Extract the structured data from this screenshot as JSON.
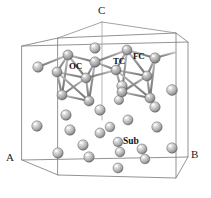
{
  "figure": {
    "kind": "crystal-unit-cell-diagram",
    "background": "#ffffff",
    "edge_color": "#6f6f6f",
    "bond_color": "#8a8a8a",
    "atom_fill": "#b9b9b9",
    "atom_highlight": "#f2f2f2",
    "atom_shadow": "#6e6e6e",
    "label_color": "#111111"
  },
  "axes": {
    "a": {
      "label": "A",
      "x": 8,
      "y": 158
    },
    "b": {
      "label": "B",
      "x": 193,
      "y": 155
    },
    "c": {
      "label": "C",
      "x": 100,
      "y": 8
    }
  },
  "site_labels": [
    {
      "id": "oc",
      "label": "OC",
      "x": 70,
      "y": 66
    },
    {
      "id": "tc",
      "label": "TC",
      "x": 114,
      "y": 61
    },
    {
      "id": "fc",
      "label": "FC",
      "x": 134,
      "y": 56
    },
    {
      "id": "sub",
      "label": "Sub",
      "x": 121,
      "y": 141
    }
  ],
  "cell": {
    "front_bottom_left": {
      "x": 22,
      "y": 160
    },
    "front_bottom_right": {
      "x": 188,
      "y": 157
    },
    "front_top_left": {
      "x": 22,
      "y": 46
    },
    "front_top_right": {
      "x": 188,
      "y": 42
    },
    "back_bottom_left": {
      "x": 58,
      "y": 175
    },
    "back_bottom_right": {
      "x": 176,
      "y": 178
    },
    "back_top_left": {
      "x": 58,
      "y": 38
    },
    "back_top_right": {
      "x": 176,
      "y": 33
    },
    "apex_c": {
      "x": 102,
      "y": 22
    }
  },
  "atoms": [
    {
      "x": 38,
      "y": 67,
      "r": 5.2
    },
    {
      "x": 95,
      "y": 48,
      "r": 5.2
    },
    {
      "x": 122,
      "y": 86,
      "r": 5.2
    },
    {
      "x": 172,
      "y": 90,
      "r": 5.4
    },
    {
      "x": 66,
      "y": 115,
      "r": 5.2
    },
    {
      "x": 100,
      "y": 110,
      "r": 5.2
    },
    {
      "x": 119,
      "y": 100,
      "r": 4.6
    },
    {
      "x": 155,
      "y": 107,
      "r": 5.2
    },
    {
      "x": 128,
      "y": 120,
      "r": 5.0
    },
    {
      "x": 37,
      "y": 126,
      "r": 5.2
    },
    {
      "x": 70,
      "y": 130,
      "r": 5.2
    },
    {
      "x": 100,
      "y": 133,
      "r": 5.0
    },
    {
      "x": 110,
      "y": 127,
      "r": 4.8
    },
    {
      "x": 157,
      "y": 127,
      "r": 5.2
    },
    {
      "x": 83,
      "y": 145,
      "r": 5.2
    },
    {
      "x": 118,
      "y": 142,
      "r": 4.8
    },
    {
      "x": 142,
      "y": 149,
      "r": 5.0
    },
    {
      "x": 172,
      "y": 148,
      "r": 5.2
    },
    {
      "x": 58,
      "y": 153,
      "r": 5.2
    },
    {
      "x": 89,
      "y": 157,
      "r": 5.2
    },
    {
      "x": 120,
      "y": 152,
      "r": 4.8
    },
    {
      "x": 145,
      "y": 159,
      "r": 4.8
    },
    {
      "x": 118,
      "y": 168,
      "r": 5.0
    }
  ],
  "cluster_left": {
    "center": {
      "x": 72,
      "y": 75
    },
    "vertices": [
      {
        "x": 68,
        "y": 55,
        "r": 5.0
      },
      {
        "x": 95,
        "y": 62,
        "r": 5.2
      },
      {
        "x": 57,
        "y": 72,
        "r": 5.0
      },
      {
        "x": 86,
        "y": 78,
        "r": 5.0
      },
      {
        "x": 62,
        "y": 95,
        "r": 5.0
      },
      {
        "x": 89,
        "y": 101,
        "r": 5.0
      }
    ]
  },
  "cluster_right": {
    "center": {
      "x": 135,
      "y": 72
    },
    "vertices": [
      {
        "x": 127,
        "y": 50,
        "r": 5.0
      },
      {
        "x": 155,
        "y": 58,
        "r": 5.2
      },
      {
        "x": 116,
        "y": 70,
        "r": 5.0
      },
      {
        "x": 147,
        "y": 76,
        "r": 5.0
      },
      {
        "x": 122,
        "y": 92,
        "r": 5.0
      },
      {
        "x": 150,
        "y": 98,
        "r": 5.0
      }
    ]
  }
}
